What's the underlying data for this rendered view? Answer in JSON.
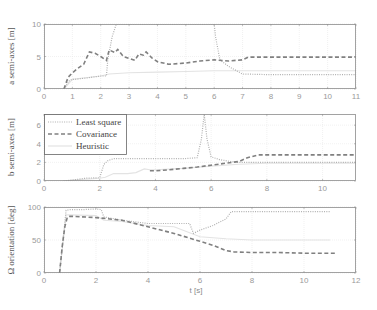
{
  "chart_data": [
    {
      "type": "line",
      "title": "",
      "xlabel": "",
      "ylabel": "a semi-axes [m]",
      "xlim": [
        0,
        11
      ],
      "ylim": [
        0,
        10
      ],
      "xticks": [
        0,
        1,
        2,
        3,
        4,
        5,
        6,
        7,
        8,
        9,
        10,
        11
      ],
      "yticks": [
        0,
        5,
        10
      ],
      "grid": true,
      "series": [
        {
          "name": "Least square",
          "style": "dotted",
          "color": "#b0b0b0",
          "x": [
            0.7,
            0.9,
            1.0,
            1.1,
            1.5,
            2.0,
            2.2,
            2.25,
            2.4,
            2.55,
            3.0,
            4.0,
            5.0,
            6.0,
            6.05,
            6.2,
            6.5,
            7.0,
            8.0,
            9.0,
            10.0,
            11.0
          ],
          "y": [
            0.0,
            1.3,
            1.5,
            1.5,
            1.7,
            2.0,
            2.0,
            4.5,
            8.0,
            10.0,
            10.0,
            10.0,
            10.0,
            10.0,
            8.0,
            4.5,
            3.5,
            2.3,
            2.2,
            2.2,
            2.2,
            2.2
          ]
        },
        {
          "name": "Covariance",
          "style": "dashed",
          "color": "#808080",
          "x": [
            0.7,
            0.85,
            1.0,
            1.2,
            1.4,
            1.6,
            1.8,
            2.0,
            2.2,
            2.3,
            2.5,
            2.6,
            2.8,
            3.0,
            3.2,
            3.35,
            3.5,
            3.6,
            3.8,
            4.0,
            4.4,
            5.0,
            5.5,
            6.0,
            6.5,
            7.0,
            7.2,
            7.6,
            8.0,
            9.0,
            10.0,
            11.0
          ],
          "y": [
            0.0,
            1.8,
            2.5,
            3.2,
            3.8,
            5.7,
            5.5,
            5.0,
            4.4,
            6.0,
            5.6,
            6.1,
            5.0,
            4.7,
            4.4,
            5.4,
            5.2,
            5.7,
            4.8,
            4.2,
            3.8,
            4.0,
            4.3,
            4.5,
            4.3,
            4.5,
            4.9,
            4.9,
            4.9,
            4.9,
            4.9,
            4.9
          ]
        },
        {
          "name": "Heuristic",
          "style": "solid",
          "color": "#e3e3e3",
          "x": [
            0.7,
            1.0,
            2.0,
            2.3,
            3.0,
            4.0,
            5.0,
            6.0,
            7.0,
            8.0,
            9.0,
            10.0,
            11.0
          ],
          "y": [
            0.0,
            1.5,
            2.0,
            2.3,
            2.5,
            2.6,
            2.7,
            2.8,
            2.8,
            2.8,
            2.8,
            2.8,
            2.8
          ]
        }
      ]
    },
    {
      "type": "line",
      "title": "",
      "xlabel": "",
      "ylabel": "b semi-axes [m]",
      "xlim": [
        0,
        11.2
      ],
      "ylim": [
        0,
        7.2
      ],
      "xticks": [
        0,
        2,
        4,
        6,
        8,
        10
      ],
      "yticks": [
        0,
        2,
        4,
        6
      ],
      "grid": true,
      "legend": {
        "position": "upper left",
        "entries": [
          "Least square",
          "Covariance",
          "Heuristic"
        ]
      },
      "series": [
        {
          "name": "Least square",
          "style": "dotted",
          "color": "#b0b0b0",
          "x": [
            0.7,
            1.0,
            1.5,
            2.0,
            2.15,
            2.3,
            2.5,
            3.0,
            4.0,
            5.0,
            5.5,
            5.65,
            5.75,
            5.85,
            6.0,
            6.3,
            6.7,
            7.0,
            8.0,
            9.0,
            10.0,
            11.2
          ],
          "y": [
            0.0,
            0.1,
            0.3,
            0.35,
            1.8,
            2.2,
            2.4,
            2.4,
            2.4,
            2.4,
            2.5,
            4.5,
            7.2,
            4.5,
            2.6,
            2.3,
            2.1,
            2.0,
            2.0,
            2.0,
            2.0,
            2.0
          ]
        },
        {
          "name": "Covariance",
          "style": "dashed",
          "color": "#808080",
          "x": [
            3.8,
            4.0,
            4.5,
            5.0,
            5.5,
            6.0,
            6.5,
            7.0,
            7.3,
            7.7,
            8.0,
            9.0,
            10.0,
            11.2
          ],
          "y": [
            1.1,
            1.1,
            1.2,
            1.35,
            1.5,
            1.7,
            1.9,
            2.1,
            2.5,
            2.8,
            2.8,
            2.8,
            2.8,
            2.8
          ]
        },
        {
          "name": "Heuristic",
          "style": "solid",
          "color": "#e3e3e3",
          "x": [
            0.7,
            1.0,
            2.0,
            2.2,
            2.5,
            3.0,
            3.3,
            3.6,
            3.8,
            4.0,
            5.0,
            6.0,
            7.0,
            8.0,
            9.0,
            10.0,
            11.2
          ],
          "y": [
            0.0,
            0.1,
            0.3,
            0.4,
            0.8,
            0.8,
            0.9,
            1.3,
            1.2,
            1.2,
            1.35,
            1.6,
            1.8,
            1.9,
            1.9,
            1.9,
            1.9
          ]
        }
      ]
    },
    {
      "type": "line",
      "title": "",
      "xlabel": "t [s]",
      "ylabel": "Ω orientation [deg]",
      "xlim": [
        0,
        12
      ],
      "ylim": [
        0,
        100
      ],
      "xticks": [
        0,
        2,
        4,
        6,
        8,
        10,
        12
      ],
      "yticks": [
        0,
        50,
        100
      ],
      "grid": true,
      "series": [
        {
          "name": "Least square",
          "style": "dotted",
          "color": "#b0b0b0",
          "x": [
            0.6,
            0.85,
            1.0,
            1.5,
            2.0,
            2.2,
            2.3,
            3.0,
            4.0,
            5.0,
            5.6,
            5.75,
            6.0,
            6.5,
            7.0,
            7.2,
            8.0,
            9.0,
            10.0,
            11.0
          ],
          "y": [
            0.0,
            95.0,
            96.0,
            96.0,
            97.0,
            96.0,
            85.0,
            80.0,
            75.0,
            75.0,
            75.0,
            60.0,
            65.0,
            72.0,
            82.0,
            93.0,
            93.0,
            93.0,
            93.0,
            93.0
          ]
        },
        {
          "name": "Covariance",
          "style": "dashed",
          "color": "#808080",
          "x": [
            0.6,
            0.7,
            0.8,
            0.9,
            1.0,
            2.0,
            3.0,
            4.0,
            5.0,
            6.0,
            6.5,
            7.0,
            7.3,
            8.0,
            9.0,
            10.0,
            11.2
          ],
          "y": [
            0.0,
            40.0,
            70.0,
            85.0,
            86.0,
            84.0,
            80.0,
            70.0,
            60.0,
            48.0,
            42.0,
            34.0,
            32.0,
            31.0,
            31.0,
            30.0,
            30.0
          ]
        },
        {
          "name": "Heuristic",
          "style": "solid",
          "color": "#e3e3e3",
          "x": [
            0.6,
            0.85,
            1.0,
            2.0,
            2.3,
            3.0,
            4.0,
            5.0,
            6.0,
            7.0,
            8.0,
            9.0,
            10.0,
            11.0
          ],
          "y": [
            0.0,
            88.0,
            88.0,
            87.0,
            80.0,
            78.0,
            72.0,
            70.0,
            55.0,
            52.0,
            50.0,
            50.0,
            50.0,
            50.0
          ]
        }
      ]
    }
  ],
  "panels": [
    {
      "ylabel": "a semi-axes [m]"
    },
    {
      "ylabel": "b semi-axes [m]"
    },
    {
      "ylabel": "Ω orientation [deg]",
      "xlabel": "t [s]"
    }
  ],
  "legend": {
    "entries": [
      {
        "label": "Least square"
      },
      {
        "label": "Covariance"
      },
      {
        "label": "Heuristic"
      }
    ]
  }
}
